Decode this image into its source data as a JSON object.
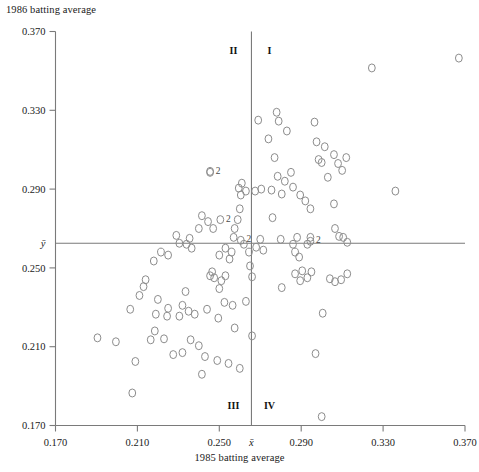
{
  "chart_data": {
    "type": "scatter",
    "title": "",
    "xlabel": "1985 batting average",
    "ylabel": "1986 batting average",
    "xlim": [
      0.17,
      0.37
    ],
    "ylim": [
      0.17,
      0.37
    ],
    "xticks": [
      "0.170",
      "0.210",
      "0.250",
      "0.290",
      "0.330",
      "0.370"
    ],
    "xtickvalues": [
      0.17,
      0.21,
      0.25,
      0.29,
      0.33,
      0.37
    ],
    "yticks": [
      "0.170",
      "0.210",
      "0.250",
      "0.290",
      "0.330",
      "0.370"
    ],
    "ytickvalues": [
      0.17,
      0.21,
      0.25,
      0.29,
      0.33,
      0.37
    ],
    "grid": false,
    "legend": "none",
    "mean_x_label": "x̄",
    "mean_y_label": "ȳ",
    "mean_x": 0.2657,
    "mean_y": 0.2625,
    "quadrant_labels": [
      "I",
      "II",
      "III",
      "IV"
    ],
    "duplicate_marker_label": "2",
    "duplicate_markers": [
      {
        "x": 0.2455,
        "y": 0.2985
      },
      {
        "x": 0.2505,
        "y": 0.2745
      },
      {
        "x": 0.2605,
        "y": 0.264
      },
      {
        "x": 0.2945,
        "y": 0.2635
      }
    ],
    "point_color": "#8c8c8c",
    "axis_color": "#7a7a7a",
    "points": [
      {
        "x": 0.1905,
        "y": 0.2145
      },
      {
        "x": 0.1995,
        "y": 0.2125
      },
      {
        "x": 0.209,
        "y": 0.2025
      },
      {
        "x": 0.2075,
        "y": 0.1865
      },
      {
        "x": 0.2215,
        "y": 0.258
      },
      {
        "x": 0.225,
        "y": 0.2565
      },
      {
        "x": 0.218,
        "y": 0.2535
      },
      {
        "x": 0.2305,
        "y": 0.2625
      },
      {
        "x": 0.234,
        "y": 0.262
      },
      {
        "x": 0.2355,
        "y": 0.265
      },
      {
        "x": 0.2365,
        "y": 0.26
      },
      {
        "x": 0.229,
        "y": 0.2665
      },
      {
        "x": 0.24,
        "y": 0.27
      },
      {
        "x": 0.2415,
        "y": 0.2765
      },
      {
        "x": 0.2445,
        "y": 0.2735
      },
      {
        "x": 0.247,
        "y": 0.27
      },
      {
        "x": 0.2455,
        "y": 0.299
      },
      {
        "x": 0.2335,
        "y": 0.238
      },
      {
        "x": 0.232,
        "y": 0.231
      },
      {
        "x": 0.225,
        "y": 0.2295
      },
      {
        "x": 0.22,
        "y": 0.234
      },
      {
        "x": 0.214,
        "y": 0.244
      },
      {
        "x": 0.213,
        "y": 0.2405
      },
      {
        "x": 0.211,
        "y": 0.236
      },
      {
        "x": 0.2065,
        "y": 0.229
      },
      {
        "x": 0.219,
        "y": 0.2265
      },
      {
        "x": 0.2245,
        "y": 0.2255
      },
      {
        "x": 0.2305,
        "y": 0.2255
      },
      {
        "x": 0.235,
        "y": 0.228
      },
      {
        "x": 0.238,
        "y": 0.2265
      },
      {
        "x": 0.244,
        "y": 0.229
      },
      {
        "x": 0.2165,
        "y": 0.2135
      },
      {
        "x": 0.2185,
        "y": 0.218
      },
      {
        "x": 0.223,
        "y": 0.214
      },
      {
        "x": 0.2275,
        "y": 0.206
      },
      {
        "x": 0.232,
        "y": 0.207
      },
      {
        "x": 0.236,
        "y": 0.2135
      },
      {
        "x": 0.24,
        "y": 0.2105
      },
      {
        "x": 0.243,
        "y": 0.205
      },
      {
        "x": 0.2465,
        "y": 0.248
      },
      {
        "x": 0.2475,
        "y": 0.245
      },
      {
        "x": 0.25,
        "y": 0.2395
      },
      {
        "x": 0.251,
        "y": 0.2435
      },
      {
        "x": 0.253,
        "y": 0.246
      },
      {
        "x": 0.25,
        "y": 0.2565
      },
      {
        "x": 0.253,
        "y": 0.26
      },
      {
        "x": 0.256,
        "y": 0.258
      },
      {
        "x": 0.255,
        "y": 0.2545
      },
      {
        "x": 0.257,
        "y": 0.2655
      },
      {
        "x": 0.2575,
        "y": 0.27
      },
      {
        "x": 0.259,
        "y": 0.2745
      },
      {
        "x": 0.26,
        "y": 0.28
      },
      {
        "x": 0.2605,
        "y": 0.287
      },
      {
        "x": 0.2595,
        "y": 0.2905
      },
      {
        "x": 0.261,
        "y": 0.293
      },
      {
        "x": 0.263,
        "y": 0.289
      },
      {
        "x": 0.262,
        "y": 0.262
      },
      {
        "x": 0.2645,
        "y": 0.258
      },
      {
        "x": 0.265,
        "y": 0.251
      },
      {
        "x": 0.266,
        "y": 0.2455
      },
      {
        "x": 0.263,
        "y": 0.233
      },
      {
        "x": 0.266,
        "y": 0.2155
      },
      {
        "x": 0.268,
        "y": 0.2605
      },
      {
        "x": 0.27,
        "y": 0.2645
      },
      {
        "x": 0.2715,
        "y": 0.259
      },
      {
        "x": 0.2675,
        "y": 0.289
      },
      {
        "x": 0.2705,
        "y": 0.29
      },
      {
        "x": 0.269,
        "y": 0.325
      },
      {
        "x": 0.274,
        "y": 0.3155
      },
      {
        "x": 0.278,
        "y": 0.329
      },
      {
        "x": 0.279,
        "y": 0.3245
      },
      {
        "x": 0.283,
        "y": 0.3195
      },
      {
        "x": 0.277,
        "y": 0.306
      },
      {
        "x": 0.2785,
        "y": 0.2965
      },
      {
        "x": 0.282,
        "y": 0.294
      },
      {
        "x": 0.285,
        "y": 0.2985
      },
      {
        "x": 0.2805,
        "y": 0.2875
      },
      {
        "x": 0.286,
        "y": 0.291
      },
      {
        "x": 0.2895,
        "y": 0.287
      },
      {
        "x": 0.292,
        "y": 0.284
      },
      {
        "x": 0.2945,
        "y": 0.28
      },
      {
        "x": 0.2755,
        "y": 0.2895
      },
      {
        "x": 0.276,
        "y": 0.2755
      },
      {
        "x": 0.28,
        "y": 0.2645
      },
      {
        "x": 0.286,
        "y": 0.262
      },
      {
        "x": 0.288,
        "y": 0.2655
      },
      {
        "x": 0.287,
        "y": 0.258
      },
      {
        "x": 0.289,
        "y": 0.2555
      },
      {
        "x": 0.287,
        "y": 0.247
      },
      {
        "x": 0.2895,
        "y": 0.2435
      },
      {
        "x": 0.2905,
        "y": 0.2485
      },
      {
        "x": 0.293,
        "y": 0.245
      },
      {
        "x": 0.295,
        "y": 0.248
      },
      {
        "x": 0.2805,
        "y": 0.24
      },
      {
        "x": 0.293,
        "y": 0.262
      },
      {
        "x": 0.2945,
        "y": 0.2655
      },
      {
        "x": 0.2985,
        "y": 0.305
      },
      {
        "x": 0.3,
        "y": 0.3035
      },
      {
        "x": 0.306,
        "y": 0.3075
      },
      {
        "x": 0.2975,
        "y": 0.314
      },
      {
        "x": 0.3015,
        "y": 0.3115
      },
      {
        "x": 0.2965,
        "y": 0.324
      },
      {
        "x": 0.303,
        "y": 0.296
      },
      {
        "x": 0.308,
        "y": 0.303
      },
      {
        "x": 0.31,
        "y": 0.2995
      },
      {
        "x": 0.312,
        "y": 0.306
      },
      {
        "x": 0.306,
        "y": 0.2825
      },
      {
        "x": 0.3065,
        "y": 0.27
      },
      {
        "x": 0.3085,
        "y": 0.266
      },
      {
        "x": 0.3105,
        "y": 0.2655
      },
      {
        "x": 0.3125,
        "y": 0.263
      },
      {
        "x": 0.3095,
        "y": 0.244
      },
      {
        "x": 0.3125,
        "y": 0.247
      },
      {
        "x": 0.304,
        "y": 0.2445
      },
      {
        "x": 0.3065,
        "y": 0.243
      },
      {
        "x": 0.3005,
        "y": 0.227
      },
      {
        "x": 0.3,
        "y": 0.1745
      },
      {
        "x": 0.3245,
        "y": 0.3515
      },
      {
        "x": 0.367,
        "y": 0.3565
      },
      {
        "x": 0.336,
        "y": 0.289
      },
      {
        "x": 0.297,
        "y": 0.2065
      },
      {
        "x": 0.26,
        "y": 0.199
      },
      {
        "x": 0.249,
        "y": 0.203
      },
      {
        "x": 0.2545,
        "y": 0.2015
      },
      {
        "x": 0.2415,
        "y": 0.196
      },
      {
        "x": 0.2455,
        "y": 0.246
      },
      {
        "x": 0.2525,
        "y": 0.2325
      },
      {
        "x": 0.2565,
        "y": 0.231
      },
      {
        "x": 0.2495,
        "y": 0.2245
      },
      {
        "x": 0.2575,
        "y": 0.2195
      }
    ]
  }
}
